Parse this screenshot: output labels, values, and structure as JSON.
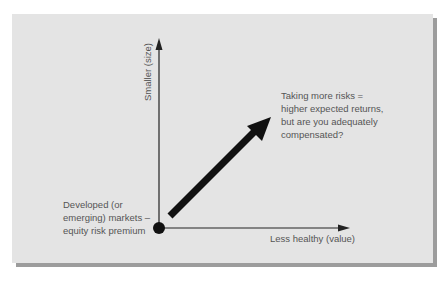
{
  "diagram": {
    "type": "risk-premium-axes",
    "colors": {
      "page_background": "#ffffff",
      "panel_background": "#e4e4e4",
      "panel_shadow": "#9c9c9c",
      "axis": "#222222",
      "arrow": "#111111",
      "text": "#555555"
    },
    "y_axis": {
      "label": "Smaller (size)"
    },
    "x_axis": {
      "label": "Less healthy (value)"
    },
    "origin": {
      "label_lines": [
        "Developed (or",
        "emerging) markets –",
        "equity risk premium"
      ]
    },
    "direction_arrow": {
      "label_lines": [
        "Taking more risks =",
        "higher expected returns,",
        "but are you adequately",
        "compensated?"
      ]
    }
  }
}
